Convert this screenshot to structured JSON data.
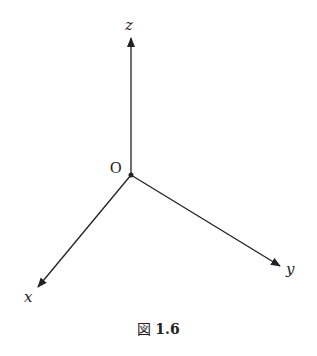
{
  "figure": {
    "caption_prefix": "図",
    "caption_number": "1.6",
    "origin_label": "O",
    "axes": [
      {
        "name": "z",
        "label": "z",
        "from": [
          131,
          175
        ],
        "to": [
          131,
          38
        ]
      },
      {
        "name": "x",
        "label": "x",
        "from": [
          131,
          175
        ],
        "to": [
          38,
          287
        ]
      },
      {
        "name": "y",
        "label": "y",
        "from": [
          131,
          175
        ],
        "to": [
          280,
          266
        ]
      }
    ],
    "stroke_color": "#222222"
  }
}
